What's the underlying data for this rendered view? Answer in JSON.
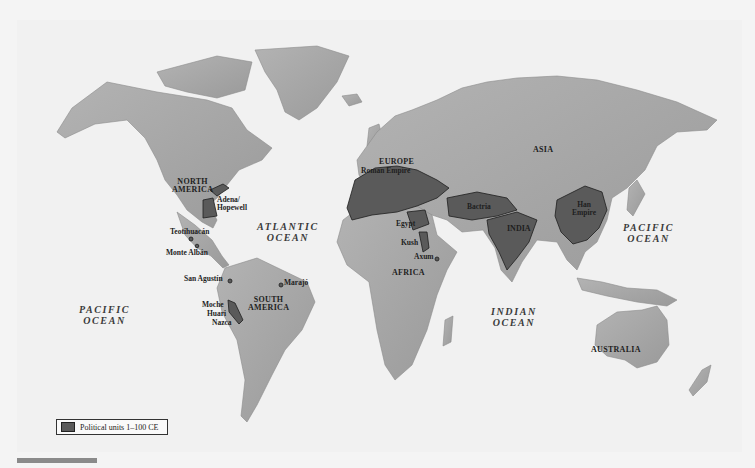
{
  "map": {
    "title_visible": false,
    "colors": {
      "ocean": "#f1f1f1",
      "land": "#a9a9a9",
      "political_unit": "#5a5a5a",
      "border": "#2a2a2a"
    },
    "continents": [
      {
        "label": "NORTH AMERICA",
        "lines": [
          "NORTH",
          "AMERICA"
        ]
      },
      {
        "label": "SOUTH AMERICA",
        "lines": [
          "SOUTH",
          "AMERICA"
        ]
      },
      {
        "label": "EUROPE",
        "lines": [
          "EUROPE"
        ]
      },
      {
        "label": "AFRICA",
        "lines": [
          "AFRICA"
        ]
      },
      {
        "label": "ASIA",
        "lines": [
          "ASIA"
        ]
      },
      {
        "label": "AUSTRALIA",
        "lines": [
          "AUSTRALIA"
        ]
      }
    ],
    "oceans": [
      {
        "label": "ATLANTIC OCEAN",
        "lines": [
          "ATLANTIC",
          "OCEAN"
        ]
      },
      {
        "label": "PACIFIC OCEAN (west)",
        "lines": [
          "PACIFIC",
          "OCEAN"
        ]
      },
      {
        "label": "PACIFIC OCEAN (east)",
        "lines": [
          "PACIFIC",
          "OCEAN"
        ]
      },
      {
        "label": "INDIAN OCEAN",
        "lines": [
          "INDIAN",
          "OCEAN"
        ]
      }
    ],
    "political_units": [
      {
        "label": "Adena/ Hopewell",
        "lines": [
          "Adena/",
          "Hopewell"
        ]
      },
      {
        "label": "Teotihuacán",
        "lines": [
          "Teotihuacán"
        ]
      },
      {
        "label": "Monte Albán",
        "lines": [
          "Monte Albán"
        ]
      },
      {
        "label": "San Agustín",
        "lines": [
          "San Agustín"
        ]
      },
      {
        "label": "Marajó",
        "lines": [
          "Marajó"
        ]
      },
      {
        "label": "Moche",
        "lines": [
          "Moche"
        ]
      },
      {
        "label": "Huari",
        "lines": [
          "Huari"
        ]
      },
      {
        "label": "Nazca",
        "lines": [
          "Nazca"
        ]
      },
      {
        "label": "Roman Empire",
        "lines": [
          "Roman Empire"
        ]
      },
      {
        "label": "Egypt",
        "lines": [
          "Egypt"
        ]
      },
      {
        "label": "Kush",
        "lines": [
          "Kush"
        ]
      },
      {
        "label": "Axum",
        "lines": [
          "Axum"
        ]
      },
      {
        "label": "Bactria",
        "lines": [
          "Bactria"
        ]
      },
      {
        "label": "INDIA",
        "lines": [
          "INDIA"
        ]
      },
      {
        "label": "Han Empire",
        "lines": [
          "Han",
          "Empire"
        ]
      }
    ],
    "legend": {
      "items": [
        {
          "label": "Political units 1–100 CE",
          "color": "#5a5a5a"
        }
      ]
    }
  }
}
